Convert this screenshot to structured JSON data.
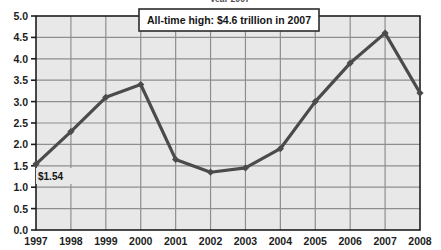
{
  "chart_data": {
    "type": "line",
    "title": "",
    "clipped_top_text": "year 2007",
    "xlabel": "",
    "ylabel": "",
    "x": [
      "1997",
      "1998",
      "1999",
      "2000",
      "2001",
      "2002",
      "2003",
      "2004",
      "2005",
      "2006",
      "2007",
      "2008"
    ],
    "categories": [
      "1997",
      "1998",
      "1999",
      "2000",
      "2001",
      "2002",
      "2003",
      "2004",
      "2005",
      "2006",
      "2007",
      "2008"
    ],
    "values": [
      1.54,
      2.3,
      3.1,
      3.4,
      1.65,
      1.35,
      1.45,
      1.9,
      3.0,
      3.9,
      4.6,
      3.2
    ],
    "series": [
      {
        "name": "value",
        "values": [
          1.54,
          2.3,
          3.1,
          3.4,
          1.65,
          1.35,
          1.45,
          1.9,
          3.0,
          3.9,
          4.6,
          3.2
        ]
      }
    ],
    "ylim": [
      0.0,
      5.0
    ],
    "ytick_step": 0.5,
    "yticks": [
      "0.0",
      "0.5",
      "1.0",
      "1.5",
      "2.0",
      "2.5",
      "3.0",
      "3.5",
      "4.0",
      "4.5",
      "5.0"
    ],
    "ytick_values": [
      0.0,
      0.5,
      1.0,
      1.5,
      2.0,
      2.5,
      3.0,
      3.5,
      4.0,
      4.5,
      5.0
    ],
    "xticks": [
      "1997",
      "1998",
      "1999",
      "2000",
      "2001",
      "2002",
      "2003",
      "2004",
      "2005",
      "2006",
      "2007",
      "2008"
    ],
    "grid": true,
    "legend": "none",
    "annotations": [
      {
        "name": "all-time-high-callout",
        "text": "All-time high: $4.6 trillion in 2007"
      },
      {
        "name": "first-point-label",
        "text": "$1.54"
      }
    ],
    "colors": {
      "line": "#4b4b4b",
      "marker": "#4b4b4b",
      "plot_background": "#e8e8e8",
      "grid": "#8e8e8e",
      "axis": "#1d1d1d",
      "page_background": "#ffffff",
      "callout_background": "#ffffff",
      "callout_border": "#2b2b2b"
    }
  },
  "callout": {
    "text": "All-time high: $4.6 trillion in 2007"
  },
  "first_label": {
    "text": "$1.54"
  }
}
